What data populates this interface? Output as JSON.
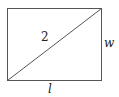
{
  "diagram": {
    "type": "rectangle-with-diagonal",
    "rectangle": {
      "x1": 7,
      "y1": 8,
      "x2": 101,
      "y2": 80
    },
    "stroke_color": "#555555",
    "labels": {
      "diagonal": "2",
      "width": "w",
      "length": "l"
    }
  }
}
